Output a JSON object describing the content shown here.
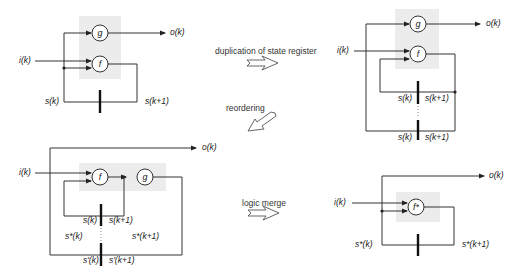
{
  "diagram": {
    "panels": {
      "top_left": {
        "nodes": {
          "g": "g",
          "f": "f"
        },
        "labels": {
          "input": "i(k)",
          "output": "o(k)",
          "state_in": "s(k)",
          "state_out": "s(k+1)"
        }
      },
      "top_right": {
        "nodes": {
          "g": "g",
          "f": "f"
        },
        "labels": {
          "input": "i(k)",
          "output": "o(k)",
          "reg1_in": "s(k)",
          "reg1_out": "s(k+1)",
          "reg2_in": "s(k)",
          "reg2_out": "s(k+1)"
        }
      },
      "bottom_left": {
        "nodes": {
          "f": "f",
          "g": "g"
        },
        "labels": {
          "input": "i(k)",
          "output": "o(k)",
          "reg1_in": "s(k)",
          "reg1_out": "s(k+1)",
          "merged_in": "s*(k)",
          "merged_out": "s*(k+1)",
          "reg2_in": "s'(k)",
          "reg2_out": "s'(k+1)"
        }
      },
      "bottom_right": {
        "nodes": {
          "fstar": "f*"
        },
        "labels": {
          "input": "i(k)",
          "output": "o(k)",
          "state_in": "s*(k)",
          "state_out": "s*(k+1)"
        }
      }
    },
    "transitions": [
      {
        "label": "duplication of state register",
        "direction": "right"
      },
      {
        "label": "reordering",
        "direction": "down-left"
      },
      {
        "label": "logic merge",
        "direction": "right"
      }
    ]
  }
}
